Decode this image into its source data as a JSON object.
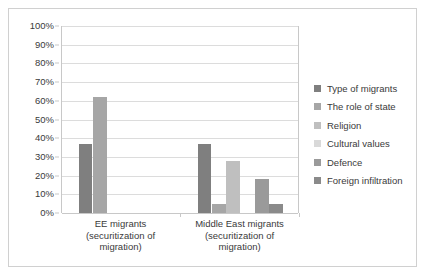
{
  "chart_data": {
    "type": "bar",
    "title": "",
    "xlabel": "",
    "ylabel": "",
    "ylim": [
      0,
      100
    ],
    "grid": true,
    "legend_position": "right",
    "ytick_labels": [
      "100%",
      "90%",
      "80%",
      "70%",
      "60%",
      "50%",
      "40%",
      "30%",
      "20%",
      "10%",
      "0%"
    ],
    "ytick_values": [
      100,
      90,
      80,
      70,
      60,
      50,
      40,
      30,
      20,
      10,
      0
    ],
    "categories": [
      "EE migrants (securitization of migration)",
      "Middle East migrants (securitization of migration)"
    ],
    "category_lines": [
      [
        "EE migrants",
        "(securitization of",
        "migration)"
      ],
      [
        "Middle East migrants",
        "(securitization of",
        "migration)"
      ]
    ],
    "series": [
      {
        "name": "Type of migrants",
        "color": "#7f7f7f",
        "values": [
          37,
          37
        ]
      },
      {
        "name": "The role of state",
        "color": "#a6a6a6",
        "values": [
          62,
          5
        ]
      },
      {
        "name": "Religion",
        "color": "#bfbfbf",
        "values": [
          0,
          28
        ]
      },
      {
        "name": "Cultural values",
        "color": "#d9d9d9",
        "values": [
          0,
          0
        ]
      },
      {
        "name": "Defence",
        "color": "#9a9a9a",
        "values": [
          0,
          18
        ]
      },
      {
        "name": "Foreign infiltration",
        "color": "#8a8a8a",
        "values": [
          0,
          5
        ]
      }
    ]
  }
}
